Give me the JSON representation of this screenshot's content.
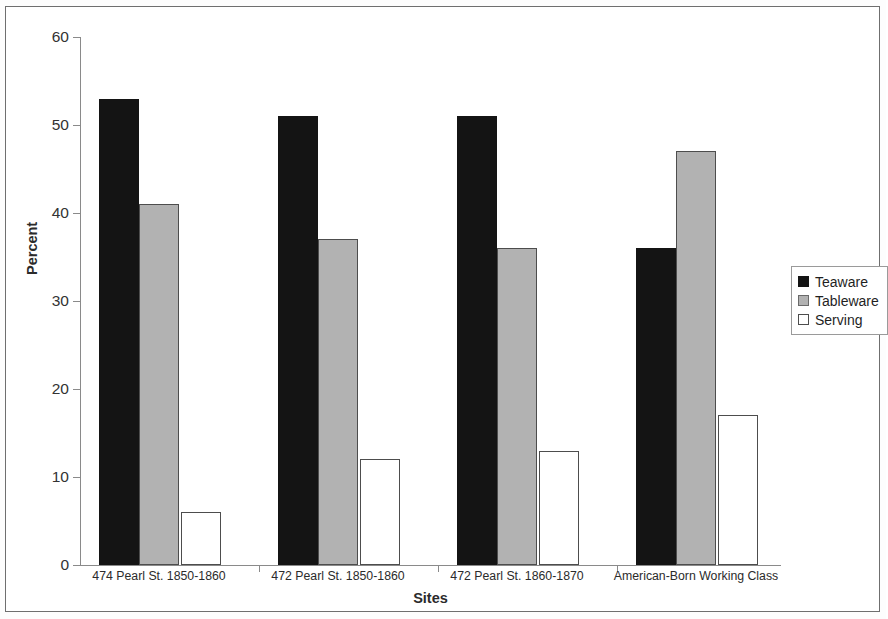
{
  "chart_data": {
    "type": "bar",
    "title": "",
    "xlabel": "Sites",
    "ylabel": "Percent",
    "ylim": [
      0,
      60
    ],
    "yticks": [
      0,
      10,
      20,
      30,
      40,
      50,
      60
    ],
    "grid": false,
    "legend_position": "right",
    "categories": [
      "474 Pearl St. 1850-1860",
      "472 Pearl St. 1850-1860",
      "472 Pearl St. 1860-1870",
      "American-Born Working Class"
    ],
    "series": [
      {
        "name": "Teaware",
        "color": "#141414",
        "values": [
          53,
          51,
          51,
          36
        ]
      },
      {
        "name": "Tableware",
        "color": "#b2b2b2",
        "values": [
          41,
          37,
          36,
          47
        ]
      },
      {
        "name": "Serving",
        "color": "#ffffff",
        "values": [
          6,
          12,
          13,
          17
        ]
      }
    ]
  },
  "legend": {
    "items": [
      {
        "label": "Teaware",
        "swatch": "teaware"
      },
      {
        "label": "Tableware",
        "swatch": "tableware"
      },
      {
        "label": "Serving",
        "swatch": "serving"
      }
    ]
  }
}
